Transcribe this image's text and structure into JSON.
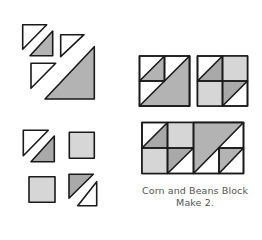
{
  "caption": {
    "title": "Corn and Beans Block",
    "instruction": "Make 2."
  },
  "colors": {
    "background": "#ffffff",
    "outline": "#1a1a1a",
    "dark_gray": "#a9a9a9",
    "light_gray": "#d6d6d6",
    "white": "#ffffff",
    "caption_text": "#555555"
  },
  "diagram": {
    "step1_pieces": [
      "white small triangle",
      "gray small triangle",
      "white small triangle",
      "white small triangle",
      "gray large triangle"
    ],
    "step2_pieces": [
      "white small triangle",
      "gray small triangle",
      "light gray square",
      "light gray square",
      "gray small triangle",
      "white small triangle"
    ],
    "units": [
      "unit A (large triangle unit)",
      "unit B (four-patch unit)"
    ],
    "block": "Corn and Beans Block"
  }
}
